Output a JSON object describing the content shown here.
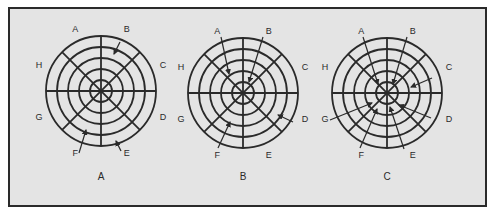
{
  "figure": {
    "background": "#e4e4e4",
    "line_color": "#2a2a2a",
    "ring_radii": [
      11,
      22,
      33,
      44,
      55
    ],
    "sector_labels": [
      "A",
      "B",
      "C",
      "D",
      "E",
      "F",
      "G",
      "H"
    ],
    "targets": [
      {
        "caption": "A",
        "center": [
          101,
          91
        ],
        "arrows": [
          {
            "sector": "B",
            "from": [
              120,
              42
            ],
            "to": [
              114,
              54
            ]
          },
          {
            "sector": "F",
            "from": [
              79,
              153
            ],
            "to": [
              86,
              130
            ]
          },
          {
            "sector": "E",
            "from": [
              121,
              151
            ],
            "to": [
              116,
              141
            ]
          }
        ]
      },
      {
        "caption": "B",
        "center": [
          243,
          93
        ],
        "arrows": [
          {
            "sector": "A",
            "from": [
              221,
              37
            ],
            "to": [
              229,
              74
            ]
          },
          {
            "sector": "B",
            "from": [
              263,
              37
            ],
            "to": [
              249,
              82
            ]
          },
          {
            "sector": "D",
            "from": [
              293,
              122
            ],
            "to": [
              278,
              115
            ]
          },
          {
            "sector": "F",
            "from": [
              218,
              148
            ],
            "to": [
              230,
              122
            ]
          }
        ]
      },
      {
        "caption": "C",
        "center": [
          387,
          93
        ],
        "arrows": [
          {
            "sector": "A",
            "from": [
              363,
              37
            ],
            "to": [
              378,
              84
            ]
          },
          {
            "sector": "B",
            "from": [
              407,
              37
            ],
            "to": [
              393,
              84
            ]
          },
          {
            "sector": "C",
            "from": [
              432,
              78
            ],
            "to": [
              411,
              87
            ]
          },
          {
            "sector": "D",
            "from": [
              431,
              118
            ],
            "to": [
              399,
              105
            ]
          },
          {
            "sector": "E",
            "from": [
              404,
              149
            ],
            "to": [
              390,
              107
            ]
          },
          {
            "sector": "F",
            "from": [
              360,
              148
            ],
            "to": [
              377,
              109
            ]
          },
          {
            "sector": "G",
            "from": [
              330,
              120
            ],
            "to": [
              372,
              103
            ]
          }
        ]
      }
    ]
  }
}
